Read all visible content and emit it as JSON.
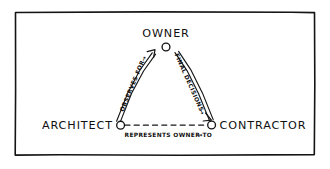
{
  "panel": {
    "name": "construction-project-roles-diagram",
    "background_color": "#ffffff",
    "frame_color": "#141414",
    "ink_color": "#171717"
  },
  "diagram": {
    "type": "triangle-relationship-diagram",
    "nodes": [
      {
        "id": "owner",
        "label": "OWNER",
        "position": "apex",
        "x": 166,
        "y": 47
      },
      {
        "id": "architect",
        "label": "ARCHITECT",
        "position": "bottom-left",
        "x": 119,
        "y": 124
      },
      {
        "id": "contractor",
        "label": "CONTRACTOR",
        "position": "bottom-right",
        "x": 213,
        "y": 124
      }
    ],
    "edges": [
      {
        "id": "architect-to-owner",
        "label": "OBSERVES FOR",
        "arrow_glyph": "→",
        "from": "architect",
        "to": "owner",
        "style": "double-stroke",
        "direction": "upward"
      },
      {
        "id": "owner-to-contractor",
        "label": "FINAL DECISIONS",
        "arrow_glyph": "→",
        "from": "owner",
        "to": "contractor",
        "style": "double-stroke",
        "direction": "downward"
      },
      {
        "id": "architect-to-contractor",
        "label": "REPRESENTS OWNER TO",
        "arrow_glyph": "→",
        "from": "architect",
        "to": "contractor",
        "style": "dashed",
        "direction": "rightward"
      }
    ]
  }
}
